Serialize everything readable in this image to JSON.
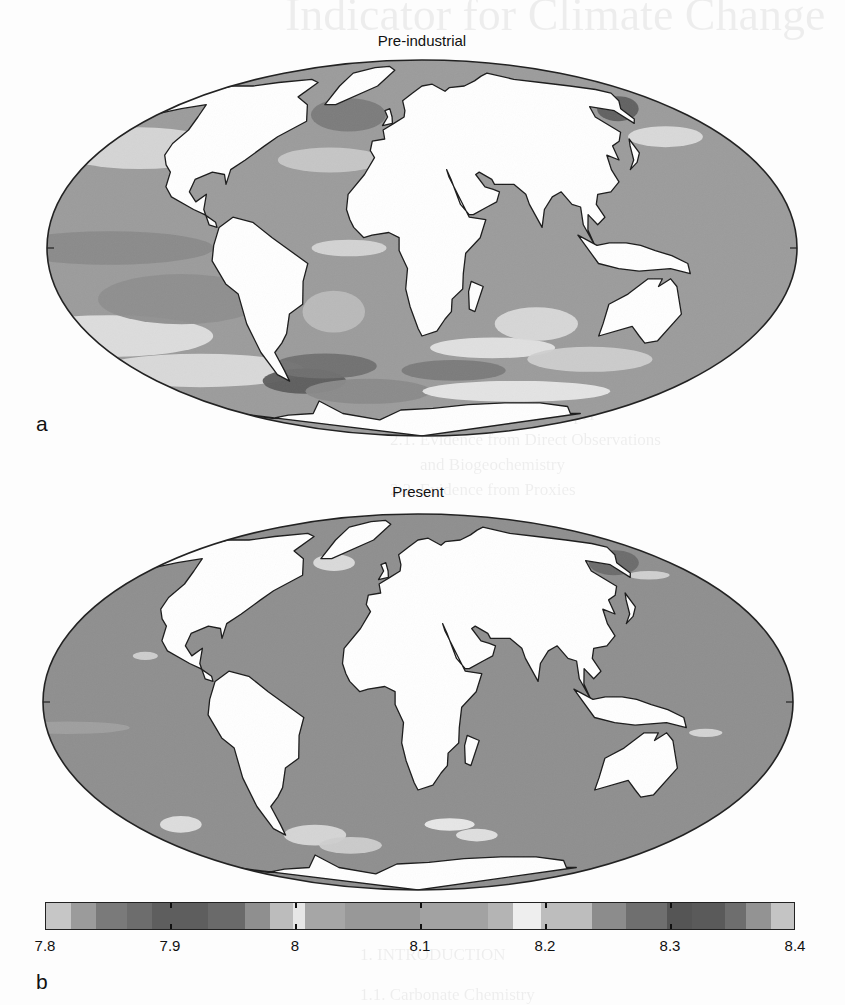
{
  "figure": {
    "panels": [
      {
        "id": "pre-industrial",
        "title": "Pre-industrial",
        "letter": "a"
      },
      {
        "id": "present",
        "title": "Present",
        "letter": ""
      }
    ],
    "colorbar_letter": "b"
  },
  "bleed_through_text": {
    "title": "Indicator for Climate Change",
    "lines": [
      "carol Jadley and John S. Frederick",
      "1. Introduction",
      "Evidence of Changes in Ocean pH",
      "2.1. Evidence from Direct Observations",
      "and Biogeochemistry",
      "2.2. Evidence from Proxies",
      "3. Calcium Carbonate",
      "4. Natural Variations of Earth",
      "1. INTRODUCTION",
      "1.1. Carbonate Chemistry"
    ]
  },
  "chart_data": {
    "type": "heatmap",
    "projection": "mollweide",
    "maps": [
      {
        "name": "Pre-industrial",
        "label": "a",
        "dominant_value": 8.15,
        "description": "Patchy pH 8.05–8.35; higher (darker) values in Southern Ocean near Drake Passage and South Atlantic, lighter bands (~8.0–8.2) in subtropical gyres and mid-latitudes"
      },
      {
        "name": "Present",
        "label": "",
        "dominant_value": 8.08,
        "description": "Mostly uniform pH ~8.05–8.1 across oceans; darker (higher) patches in North Pacific near Kamchatka/Alaska; light spots (~8.2) in Southern Ocean"
      }
    ],
    "colorbar": {
      "range": [
        7.8,
        8.4
      ],
      "ticks": [
        7.8,
        7.9,
        8.0,
        8.1,
        8.2,
        8.3,
        8.4
      ],
      "tick_labels": [
        "7.8",
        "7.9",
        "8",
        "8.1",
        "8.2",
        "8.3",
        "8.4"
      ],
      "segments": [
        {
          "from": 7.8,
          "to": 7.82,
          "color": "#c6c6c6"
        },
        {
          "from": 7.82,
          "to": 7.84,
          "color": "#9b9b9b"
        },
        {
          "from": 7.84,
          "to": 7.865,
          "color": "#7a7a7a"
        },
        {
          "from": 7.865,
          "to": 7.885,
          "color": "#6d6d6d"
        },
        {
          "from": 7.885,
          "to": 7.93,
          "color": "#5e5e5e"
        },
        {
          "from": 7.93,
          "to": 7.96,
          "color": "#6a6a6a"
        },
        {
          "from": 7.96,
          "to": 7.98,
          "color": "#8f8f8f"
        },
        {
          "from": 7.98,
          "to": 7.998,
          "color": "#bcbcbc"
        },
        {
          "from": 7.998,
          "to": 8.008,
          "color": "#e6e6e6"
        },
        {
          "from": 8.008,
          "to": 8.04,
          "color": "#a6a6a6"
        },
        {
          "from": 8.04,
          "to": 8.1,
          "color": "#989898"
        },
        {
          "from": 8.1,
          "to": 8.155,
          "color": "#a2a2a2"
        },
        {
          "from": 8.155,
          "to": 8.175,
          "color": "#b4b4b4"
        },
        {
          "from": 8.175,
          "to": 8.197,
          "color": "#eeeeee"
        },
        {
          "from": 8.197,
          "to": 8.238,
          "color": "#bdbdbd"
        },
        {
          "from": 8.238,
          "to": 8.265,
          "color": "#8c8c8c"
        },
        {
          "from": 8.265,
          "to": 8.298,
          "color": "#6f6f6f"
        },
        {
          "from": 8.298,
          "to": 8.318,
          "color": "#555555"
        },
        {
          "from": 8.318,
          "to": 8.345,
          "color": "#5a5a5a"
        },
        {
          "from": 8.345,
          "to": 8.362,
          "color": "#6e6e6e"
        },
        {
          "from": 8.362,
          "to": 8.382,
          "color": "#939393"
        },
        {
          "from": 8.382,
          "to": 8.4,
          "color": "#c4c4c4"
        }
      ]
    }
  }
}
